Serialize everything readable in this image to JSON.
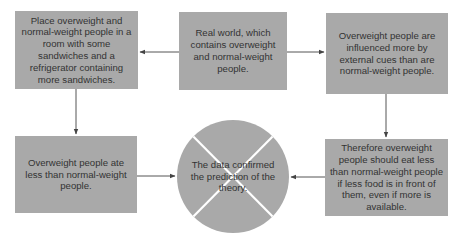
{
  "diagram": {
    "colors": {
      "box_fill": "#a9a9a9",
      "text": "#333333",
      "arrow": "#444444",
      "circle_divider": "#ffffff"
    },
    "nodes": {
      "procedure": {
        "text": "Place overweight and normal-weight people in a room with some sandwiches and a refrigerator containing more sandwiches."
      },
      "real_world": {
        "text": "Real world, which contains overweight and normal-weight people."
      },
      "theory": {
        "text": "Overweight people are influenced more by external cues than are normal-weight people."
      },
      "observation": {
        "text": "Overweight people ate less than normal-weight people."
      },
      "prediction": {
        "text": "Therefore overweight people should eat less than normal-weight people if less food is in front of them, even if more is available."
      },
      "conclusion": {
        "text": "The data confirmed the prediction of the theory.",
        "shape": "circle-with-x"
      }
    },
    "edges": [
      {
        "from": "real_world",
        "to": "procedure",
        "direction": "left"
      },
      {
        "from": "real_world",
        "to": "theory",
        "direction": "right"
      },
      {
        "from": "procedure",
        "to": "observation",
        "direction": "down"
      },
      {
        "from": "theory",
        "to": "prediction",
        "direction": "down"
      },
      {
        "from": "observation",
        "to": "conclusion",
        "direction": "right"
      },
      {
        "from": "prediction",
        "to": "conclusion",
        "direction": "left"
      }
    ]
  }
}
